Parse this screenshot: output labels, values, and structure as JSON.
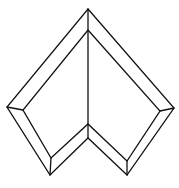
{
  "diagram": {
    "stroke_color": "#111111",
    "background_color": "#ffffff",
    "outer_polygon": [
      [
        88,
        9
      ],
      [
        174,
        108
      ],
      [
        127,
        175
      ],
      [
        88,
        138
      ],
      [
        50,
        175
      ],
      [
        7,
        107
      ]
    ],
    "inner_polygon": [
      [
        88,
        30
      ],
      [
        160,
        111
      ],
      [
        127,
        161
      ],
      [
        88,
        124
      ],
      [
        51,
        158
      ],
      [
        23,
        110
      ]
    ],
    "bevel_connectors": [
      [
        [
          174,
          108
        ],
        [
          160,
          111
        ]
      ],
      [
        [
          127,
          175
        ],
        [
          127,
          161
        ]
      ],
      [
        [
          50,
          175
        ],
        [
          51,
          158
        ]
      ],
      [
        [
          7,
          107
        ],
        [
          23,
          110
        ]
      ]
    ],
    "center_line": [
      [
        88,
        9
      ],
      [
        88,
        138
      ]
    ]
  }
}
